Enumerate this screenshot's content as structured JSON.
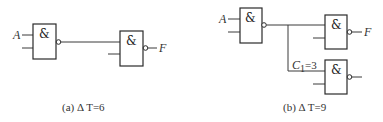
{
  "diagram_a": {
    "caption": "(a) Δ T=6",
    "input_label": "A",
    "output_label": "F",
    "gates": [
      {
        "id": "a-gate-1",
        "symbol": "&",
        "type": "NAND"
      },
      {
        "id": "a-gate-2",
        "symbol": "&",
        "type": "NAND"
      }
    ]
  },
  "diagram_b": {
    "caption": "(b) Δ T=9",
    "input_label": "A",
    "output_label": "F",
    "load_label_main": "C",
    "load_label_sub": "1",
    "load_label_value": "=3",
    "gates": [
      {
        "id": "b-gate-1",
        "symbol": "&",
        "type": "NAND"
      },
      {
        "id": "b-gate-2",
        "symbol": "&",
        "type": "NAND"
      },
      {
        "id": "b-gate-3",
        "symbol": "&",
        "type": "NAND"
      }
    ]
  },
  "colors": {
    "line": "#2a2a2a",
    "text": "#333333",
    "background": "#ffffff"
  }
}
